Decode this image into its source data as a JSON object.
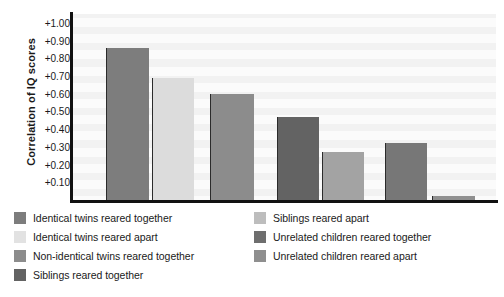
{
  "chart_data": {
    "type": "bar",
    "title": "",
    "subtitle": "",
    "xlabel": "",
    "ylabel": "Correlation of IQ scores",
    "ylim": [
      0.0,
      1.05
    ],
    "grid": true,
    "grid_orientation": "horizontal",
    "legend_position": "below",
    "y_ticks": [
      {
        "label": "+1.00",
        "value": 1.0
      },
      {
        "label": "+0.90",
        "value": 0.9
      },
      {
        "label": "+0.80",
        "value": 0.8
      },
      {
        "label": "+0.70",
        "value": 0.7
      },
      {
        "label": "+0.60",
        "value": 0.6
      },
      {
        "label": "+0.50",
        "value": 0.5
      },
      {
        "label": "+0.40",
        "value": 0.4
      },
      {
        "label": "+0.30",
        "value": 0.3
      },
      {
        "label": "+0.20",
        "value": 0.2
      },
      {
        "label": "+0.10",
        "value": 0.1
      }
    ],
    "categories": [
      "Identical twins reared together",
      "Identical twins reared apart",
      "Non-identical twins reared together",
      "Siblings reared together",
      "Siblings reared apart",
      "Unrelated children reared together",
      "Unrelated children reared apart"
    ],
    "values": [
      0.86,
      0.69,
      0.6,
      0.47,
      0.27,
      0.32,
      0.02
    ],
    "bar_colors": [
      "#7d7d7d",
      "#dcdcdc",
      "#8c8c8c",
      "#636363",
      "#a3a3a3",
      "#777777",
      "#8f8f8f"
    ],
    "bars": [
      {
        "category": "Identical twins reared together",
        "value": 0.86,
        "color": "#7d7d7d"
      },
      {
        "category": "Identical twins reared apart",
        "value": 0.69,
        "color": "#dcdcdc"
      },
      {
        "category": "Non-identical twins reared together",
        "value": 0.6,
        "color": "#8c8c8c"
      },
      {
        "category": "Siblings reared together",
        "value": 0.47,
        "color": "#636363"
      },
      {
        "category": "Siblings reared apart",
        "value": 0.27,
        "color": "#a3a3a3"
      },
      {
        "category": "Unrelated children reared together",
        "value": 0.32,
        "color": "#777777"
      },
      {
        "category": "Unrelated children reared apart",
        "value": 0.02,
        "color": "#8f8f8f"
      }
    ],
    "legend": [
      {
        "label": "Identical twins reared together",
        "color": "#7d7d7d"
      },
      {
        "label": "Identical twins reared apart",
        "color": "#e2e2e2"
      },
      {
        "label": "Non-identical twins reared together",
        "color": "#8c8c8c"
      },
      {
        "label": "Siblings reared together",
        "color": "#636363"
      },
      {
        "label": "Siblings reared apart",
        "color": "#bdbdbd"
      },
      {
        "label": "Unrelated children reared together",
        "color": "#6e6e6e"
      },
      {
        "label": "Unrelated children reared apart",
        "color": "#8f8f8f"
      }
    ],
    "legend_columns": {
      "left": [
        0,
        1,
        2,
        3
      ],
      "right": [
        4,
        5,
        6
      ]
    },
    "colors": {
      "plot_background": "#f2f2f2",
      "band": "#fbfbfb",
      "axis": "#111111",
      "text": "#1a1a1a",
      "bar_edge": "#2b2b2b"
    }
  }
}
